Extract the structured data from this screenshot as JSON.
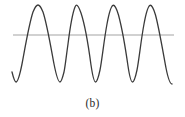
{
  "figure": {
    "caption": "(b)",
    "background_color": "#ffffff",
    "width": 185,
    "height": 117
  },
  "chart_data": {
    "type": "line",
    "title": "",
    "subtitle": "",
    "xlabel": "",
    "ylabel": "",
    "grid": false,
    "legend": null,
    "axes_visible": false,
    "tick_labels_x": [],
    "tick_labels_y": [],
    "xlim": [
      12,
      173
    ],
    "ylim": [
      84,
      5
    ],
    "series": [
      {
        "name": "oscillating-waveform",
        "color": "#3a3a3a",
        "stroke_width": 1.3,
        "shape": "periodic-wave",
        "period_px": 37,
        "peak_y": 5,
        "trough_y": 82,
        "peaks_x": [
          38,
          76,
          113,
          150
        ],
        "troughs_x": [
          16,
          54,
          91,
          128,
          165
        ],
        "start_point": [
          12,
          72
        ],
        "end_point": [
          172,
          84
        ],
        "path": "M 12,72 C 13.5,78 14.5,82 16,82 C 18,82 20,74 22,64 C 25,48 29,24 33,12 C 35,7 36.5,5 38,5 C 39.5,5 41,7 43,12 C 47,24 51,48 54,64 C 56,74 58,82 60,82 C 61.5,82 62.5,78 64,72 C 65,68 66,58 68,44 C 70,28 73,12 75,7 C 75.7,5.6 76,5.2 76.5,5.2 C 77.5,5.2 79,7.5 81,13 C 85,25 89,50 91,65 C 92.5,75 94,82 95.5,82 C 97,82 98.5,77 100,70 C 102,60 104,40 107,24 C 109,13 111.5,6 113,5.3 C 114.5,4.8 116.5,8 118.5,15 C 122,28 126,52 128,66 C 129.5,76 131,82 132.5,82 C 134,82 135.5,77 137,70 C 139,60 141,40 144,24 C 146,13 148.5,6 150,5.3 C 151.5,4.8 153.5,8 155.5,15 C 159,28 163,52 166,68 C 168,78 170,84 172,84"
      }
    ],
    "reference_line": {
      "name": "threshold-line",
      "orientation": "horizontal",
      "y": 35,
      "x_start": 13,
      "x_end": 174,
      "color": "#a3a3a3",
      "stroke_width": 1.1
    }
  }
}
